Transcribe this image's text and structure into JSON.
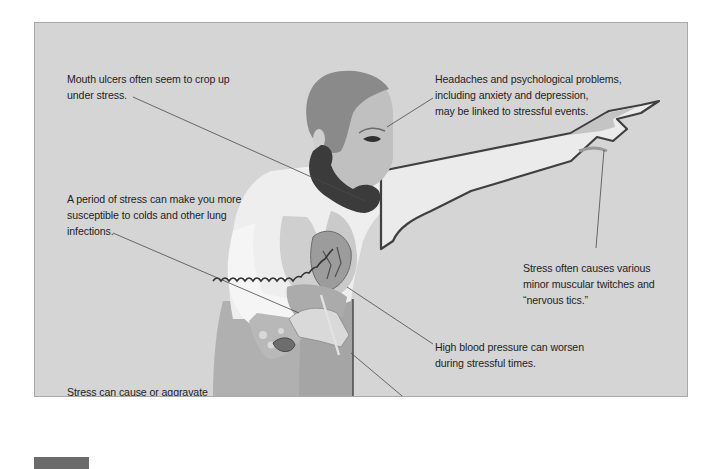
{
  "figure": {
    "colors": {
      "panel_background": "#d5d5d5",
      "panel_border": "#a9a9a9",
      "text": "#1e1e1e",
      "leader_line": "#4a4a4a",
      "figure_tab": "#6b6b6b",
      "hair": "#8a8a8a",
      "skin": "#bdbdbd",
      "shirt": "#eeeeee",
      "pants": "#a9a9a9",
      "phone": "#3b3b3b",
      "organs": "#b0b0b0",
      "heart": "#9c9c9c"
    },
    "annotations": [
      {
        "id": "mouth",
        "lines": [
          "Mouth ulcers often seem to crop up",
          "under stress."
        ]
      },
      {
        "id": "lungs",
        "lines": [
          "A period of stress can make you more",
          "susceptible to colds and other lung",
          "infections."
        ]
      },
      {
        "id": "digestive",
        "lines": [
          "Stress can cause or aggravate",
          "gastritis, ulcers, ulcerative colitis,",
          "and irritable bowel syndrome."
        ]
      },
      {
        "id": "skin",
        "lines": [
          "Skin problems such as",
          "eczema and psoriasis often",
          "appear as a result of stress."
        ]
      },
      {
        "id": "head",
        "lines": [
          "Headaches and psychological problems,",
          "including anxiety and depression,",
          "may be linked to stressful events."
        ]
      },
      {
        "id": "muscles",
        "lines": [
          "Stress often causes various",
          "minor muscular twitches and",
          "“nervous tics.”"
        ]
      },
      {
        "id": "blood-pressure",
        "lines": [
          "High blood pressure can worsen",
          "during stressful times."
        ]
      },
      {
        "id": "heart",
        "lines": [
          "Heart problems, including attacks of",
          "pain and heart rate and rhythm",
          "disturbances, are often linked to stress."
        ]
      },
      {
        "id": "reproductive",
        "lines": [
          "Stress-related problems include",
          "menstrual disorders in women",
          "and impotence and premature",
          "ejaculation in men."
        ]
      }
    ]
  }
}
